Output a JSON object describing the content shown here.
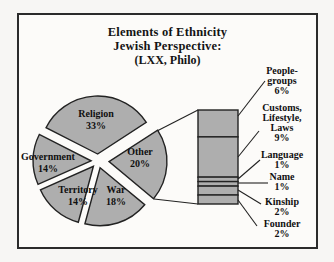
{
  "chart_data": {
    "type": "pie",
    "subtype": "bar-of-pie",
    "title_lines": [
      "Elements of Ethnicity",
      "Jewish Perspective:",
      "(LXX, Philo)"
    ],
    "unit": "%",
    "series": [
      {
        "label": "Religion",
        "value": 33,
        "pct": "33%"
      },
      {
        "label": "Other",
        "value": 20,
        "pct": "20%"
      },
      {
        "label": "War",
        "value": 18,
        "pct": "18%"
      },
      {
        "label": "Territory",
        "value": 14,
        "pct": "14%"
      },
      {
        "label": "Government",
        "value": 14,
        "pct": "14%"
      }
    ],
    "other_breakdown": [
      {
        "label": "People-groups",
        "value": 6,
        "pct": "6%"
      },
      {
        "label": "Customs, Lifestyle, Laws",
        "value": 9,
        "pct": "9%"
      },
      {
        "label": "Language",
        "value": 1,
        "pct": "1%"
      },
      {
        "label": "Name",
        "value": 1,
        "pct": "1%"
      },
      {
        "label": "Kinship",
        "value": 2,
        "pct": "2%"
      },
      {
        "label": "Founder",
        "value": 2,
        "pct": "2%"
      }
    ],
    "layout": {
      "pie_start_angle_deg": -63,
      "pie_direction": "clockwise",
      "legend": "none",
      "grid": "off",
      "colors": {
        "slice_fill": "#aeaeae",
        "slice_stroke": "#222222",
        "frame_border": "#2b2b2b",
        "background": "#fcfbf9",
        "text": "#141414"
      }
    }
  }
}
